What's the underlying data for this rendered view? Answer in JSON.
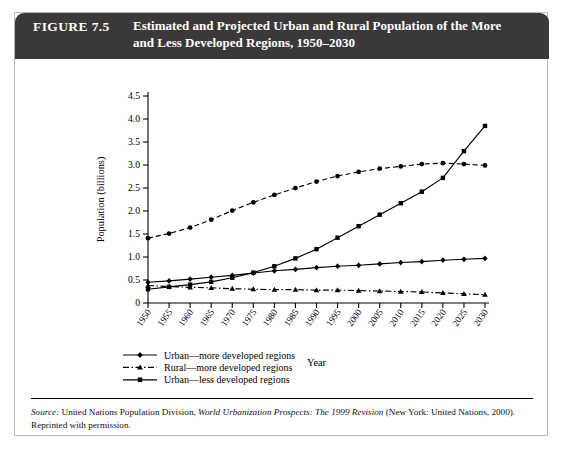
{
  "figure": {
    "number": "FIGURE 7.5",
    "title": "Estimated and Projected Urban and Rural Population of the More and Less Developed Regions, 1950–2030",
    "title_line1": "Estimated and Projected Urban and Rural Population of the More",
    "title_line2": "and Less Developed Regions, 1950–2030",
    "header_bg": "#3a3839",
    "header_fg": "#ffffff",
    "border_color": "#b9b9b9"
  },
  "source": {
    "label": "Source:",
    "text_before_italic": " United Nations Population Division, ",
    "italic_text": "World Urbanization Prospects: The 1999 Revision",
    "text_after_italic": " (New York: United Nations, 2000). Reprinted with permission."
  },
  "chart_data": {
    "type": "line",
    "title": "",
    "xlabel": "Year",
    "ylabel": "Population (billions)",
    "xlim": [
      1950,
      2030
    ],
    "ylim": [
      0,
      4.5
    ],
    "ytick_step": 0.5,
    "grid": false,
    "legend_position": "below-left",
    "x": [
      1950,
      1955,
      1960,
      1965,
      1970,
      1975,
      1980,
      1985,
      1990,
      1995,
      2000,
      2005,
      2010,
      2015,
      2020,
      2025,
      2030
    ],
    "xticklabels": [
      "1950",
      "1955",
      "1960",
      "1965",
      "1970",
      "1975",
      "1980",
      "1985",
      "1990",
      "1995",
      "2000",
      "2005",
      "2010",
      "2015",
      "2020",
      "2025",
      "2030"
    ],
    "yticklabels": [
      "0",
      "0.5",
      "1.0",
      "1.5",
      "2.0",
      "2.5",
      "3.0",
      "3.5",
      "4.0",
      "4.5"
    ],
    "series": [
      {
        "name": "Urban—more developed regions",
        "marker": "diamond",
        "line": "solid",
        "color": "#000000",
        "values": [
          0.45,
          0.48,
          0.52,
          0.56,
          0.6,
          0.65,
          0.7,
          0.73,
          0.77,
          0.8,
          0.82,
          0.85,
          0.88,
          0.9,
          0.93,
          0.95,
          0.97
        ]
      },
      {
        "name": "Rural—more developed regions",
        "marker": "triangle",
        "line": "dashdot",
        "color": "#000000",
        "values": [
          0.38,
          0.36,
          0.34,
          0.33,
          0.31,
          0.3,
          0.29,
          0.29,
          0.28,
          0.28,
          0.27,
          0.26,
          0.25,
          0.24,
          0.22,
          0.2,
          0.18
        ]
      },
      {
        "name": "Urban—less developed regions",
        "marker": "square",
        "line": "solid",
        "color": "#000000",
        "values": [
          0.3,
          0.35,
          0.4,
          0.46,
          0.55,
          0.66,
          0.8,
          0.97,
          1.17,
          1.42,
          1.67,
          1.92,
          2.17,
          2.42,
          2.72,
          3.3,
          3.85
        ]
      },
      {
        "name": "Rural—less developed regions",
        "marker": "circle",
        "line": "dashed",
        "color": "#000000",
        "values": [
          1.41,
          1.51,
          1.64,
          1.81,
          2.01,
          2.19,
          2.35,
          2.5,
          2.64,
          2.76,
          2.85,
          2.92,
          2.97,
          3.02,
          3.04,
          3.02,
          2.99
        ]
      }
    ],
    "legend": [
      {
        "label": "Urban—more developed regions",
        "marker": "diamond",
        "line": "solid"
      },
      {
        "label": "Rural—more developed regions",
        "marker": "triangle",
        "line": "dashdot"
      },
      {
        "label": "Urban—less developed regions",
        "marker": "square",
        "line": "solid"
      },
      {
        "label": "Rural—less developed regions",
        "marker": "circle",
        "line": "dashed"
      }
    ]
  }
}
